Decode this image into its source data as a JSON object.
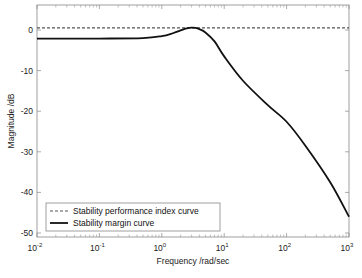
{
  "chart_data": {
    "type": "line",
    "title": "",
    "xlabel": "Frequency /rad/sec",
    "ylabel": "Magnitude /dB",
    "xscale": "log",
    "xlim": [
      0.01,
      1000
    ],
    "ylim": [
      -51,
      6
    ],
    "x_ticks": [
      {
        "value": 0.01,
        "base": "10",
        "exp": "-2"
      },
      {
        "value": 0.1,
        "base": "10",
        "exp": "-1"
      },
      {
        "value": 1,
        "base": "10",
        "exp": "0"
      },
      {
        "value": 10,
        "base": "10",
        "exp": "1"
      },
      {
        "value": 100,
        "base": "10",
        "exp": "2"
      },
      {
        "value": 1000,
        "base": "10",
        "exp": "3"
      }
    ],
    "y_ticks": [
      0,
      -10,
      -20,
      -30,
      -40,
      -50
    ],
    "y_tick_labels": [
      "0",
      "-10",
      "-20",
      "-30",
      "-40",
      "-50"
    ],
    "grid": false,
    "legend_position": "lower left",
    "series": [
      {
        "name": "Stability performance index curve",
        "style": "dashed",
        "color": "#555555",
        "x": [
          0.01,
          1000
        ],
        "y": [
          0.5,
          0.5
        ]
      },
      {
        "name": "Stability margin curve",
        "style": "solid",
        "color": "#111111",
        "x": [
          0.01,
          0.1,
          0.5,
          1.0,
          1.5,
          2.0,
          2.5,
          3.0,
          3.5,
          4.0,
          5.0,
          7.0,
          10,
          20,
          50,
          100,
          200,
          500,
          1000
        ],
        "y": [
          -2.1,
          -2.1,
          -2.0,
          -1.5,
          -0.8,
          -0.1,
          0.4,
          0.6,
          0.5,
          0.2,
          -0.6,
          -2.8,
          -6.5,
          -12.5,
          -18.5,
          -22.6,
          -28.5,
          -37.5,
          -46.0
        ]
      }
    ]
  }
}
